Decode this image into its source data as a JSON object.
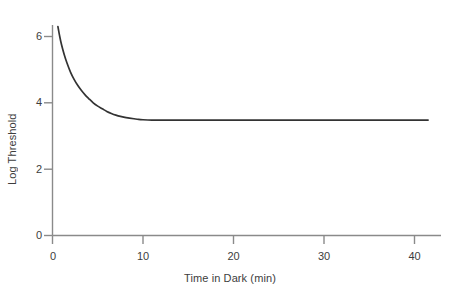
{
  "chart_data": {
    "type": "line",
    "title": "",
    "subtitle": "",
    "xlabel": "Time in Dark (min)",
    "ylabel": "Log Threshold",
    "xlim": [
      0,
      44
    ],
    "ylim": [
      0,
      6.9
    ],
    "xticks": [
      0,
      10,
      20,
      30,
      40
    ],
    "xtick_labels": [
      "0",
      "10",
      "20",
      "30",
      "40"
    ],
    "yticks": [
      0,
      2,
      4,
      6
    ],
    "ytick_labels": [
      "0",
      "2",
      "4",
      "6"
    ],
    "grid": false,
    "legend": false,
    "legend_position": "none",
    "annotations": [],
    "series": [
      {
        "name": "Dark adaptation curve",
        "color": "#333333",
        "x": [
          0.6,
          0.8,
          1.0,
          1.3,
          1.6,
          2.0,
          2.4,
          2.8,
          3.2,
          3.6,
          4.0,
          4.5,
          5.0,
          5.5,
          6.0,
          6.5,
          7.0,
          7.5,
          8.0,
          8.5,
          9.0,
          9.5,
          10.0,
          11.0,
          12.0,
          14.0,
          16.0,
          18.0,
          20.0,
          24.0,
          28.0,
          32.0,
          36.0,
          40.0,
          41.5
        ],
        "y": [
          6.3,
          6.0,
          5.75,
          5.45,
          5.2,
          4.92,
          4.7,
          4.52,
          4.37,
          4.24,
          4.13,
          4.0,
          3.9,
          3.82,
          3.74,
          3.68,
          3.63,
          3.59,
          3.56,
          3.54,
          3.52,
          3.5,
          3.49,
          3.48,
          3.48,
          3.48,
          3.48,
          3.48,
          3.48,
          3.48,
          3.48,
          3.48,
          3.48,
          3.48,
          3.48
        ]
      }
    ],
    "asymptote_value": 3.48,
    "start_value": 6.3,
    "x_range_drawn": [
      0.6,
      41.5
    ]
  },
  "axis": {
    "x_title": "Time in Dark (min)",
    "y_title": "Log Threshold",
    "x_tick_0": "0",
    "x_tick_1": "10",
    "x_tick_2": "20",
    "x_tick_3": "30",
    "x_tick_4": "40",
    "y_tick_0": "0",
    "y_tick_1": "2",
    "y_tick_2": "4",
    "y_tick_3": "6"
  },
  "colors": {
    "axis": "#8a8a8a",
    "curve": "#333333",
    "text": "#3d3d3d",
    "background": "#ffffff"
  }
}
